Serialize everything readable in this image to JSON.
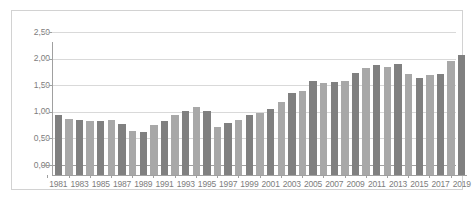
{
  "chart_data": {
    "type": "bar",
    "title": "",
    "subtitle": "",
    "xlabel": "",
    "ylabel": "",
    "categories": [
      "1981",
      "1982",
      "1983",
      "1984",
      "1985",
      "1986",
      "1987",
      "1988",
      "1989",
      "1990",
      "1991",
      "1992",
      "1993",
      "1994",
      "1995",
      "1996",
      "1997",
      "1998",
      "1999",
      "2000",
      "2001",
      "2002",
      "2003",
      "2004",
      "2005",
      "2006",
      "2007",
      "2008",
      "2009",
      "2010",
      "2011",
      "2012",
      "2013",
      "2014",
      "2015",
      "2016",
      "2017",
      "2018",
      "2019"
    ],
    "values": [
      1.13,
      1.06,
      1.04,
      1.02,
      1.02,
      1.04,
      0.95,
      0.83,
      0.81,
      0.94,
      1.02,
      1.13,
      1.21,
      1.27,
      1.2,
      0.9,
      0.97,
      1.03,
      1.13,
      1.16,
      1.25,
      1.38,
      1.55,
      1.58,
      1.76,
      1.73,
      1.75,
      1.76,
      1.91,
      2.01,
      2.06,
      2.03,
      2.09,
      1.9,
      1.82,
      1.88,
      1.9,
      2.15,
      2.25
    ],
    "bar_colors": [
      "#808080",
      "#a8a8a8"
    ],
    "ylim": [
      0,
      2.5
    ],
    "y_ticks": [
      0,
      0.5,
      1.0,
      1.5,
      2.0,
      2.5
    ],
    "y_tick_labels": [
      "0,00",
      "0,50",
      "1,00",
      "1,50",
      "2,00",
      "2,50"
    ],
    "x_tick_labels": [
      "1981",
      "1983",
      "1985",
      "1987",
      "1989",
      "1991",
      "1993",
      "1995",
      "1997",
      "1999",
      "2001",
      "2003",
      "2005",
      "2007",
      "2009",
      "2011",
      "2013",
      "2015",
      "2017",
      "2019"
    ],
    "x_tick_step": 2,
    "grid": true,
    "grid_axis": "y",
    "legend": false,
    "legend_position": "none",
    "plot_background": "#ffffff",
    "grid_color": "#d9d9d9",
    "axis_color": "#a0a0a0",
    "tick_label_color": "#7d7d7d",
    "border_color": "#d2d2d2"
  }
}
